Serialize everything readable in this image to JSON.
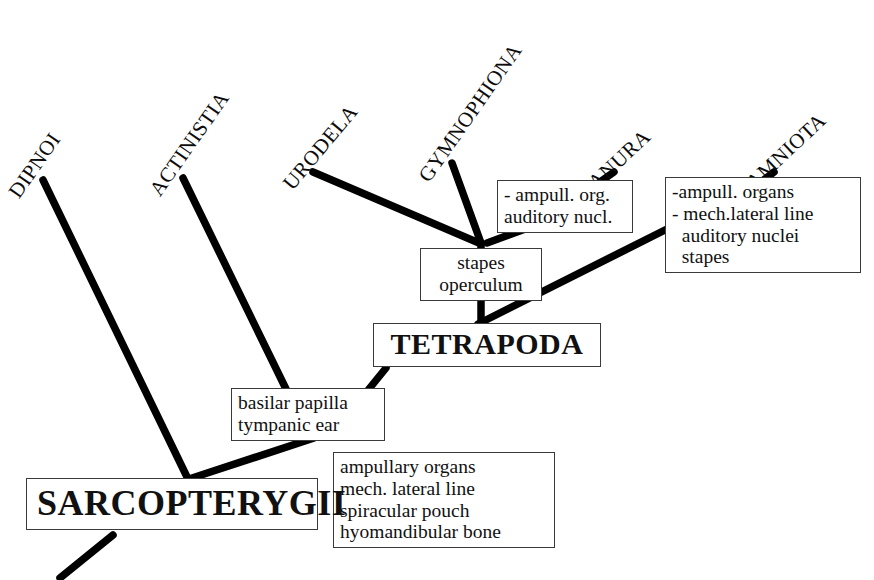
{
  "diagram": {
    "type": "cladogram",
    "background_color": "#ffffff",
    "line_color": "#000000",
    "box_border_color": "#3a3a3a"
  },
  "taxa": [
    {
      "id": "dipnoi",
      "label": "DIPNOI"
    },
    {
      "id": "actinistia",
      "label": "ACTINISTIA"
    },
    {
      "id": "urodela",
      "label": "URODELA"
    },
    {
      "id": "gymnophiona",
      "label": "GYMNOPHIONA"
    },
    {
      "id": "anura",
      "label": "ANURA"
    },
    {
      "id": "amniota",
      "label": "AMNIOTA"
    }
  ],
  "clades": [
    {
      "id": "sarcopterygii",
      "label": "SARCOPTERYGII"
    },
    {
      "id": "tetrapoda",
      "label": "TETRAPODA"
    }
  ],
  "character_boxes": [
    {
      "id": "anura-characters",
      "attached_to": "anura",
      "lines": [
        "- ampull. org.",
        "auditory nucl."
      ]
    },
    {
      "id": "amniota-characters",
      "attached_to": "amniota",
      "lines": [
        "-ampull. organs",
        "- mech.lateral line",
        "  auditory nuclei",
        "  stapes"
      ]
    },
    {
      "id": "lissamphibia-characters",
      "attached_to": "lissamphibia-node",
      "lines": [
        "stapes",
        "operculum"
      ]
    },
    {
      "id": "tetrapoda-characters",
      "attached_to": "tetrapoda-stem",
      "lines": [
        "basilar papilla",
        "tympanic ear"
      ]
    },
    {
      "id": "sarcopterygii-characters",
      "attached_to": "sarcopterygii-node",
      "lines": [
        "ampullary organs",
        "mech. lateral line",
        "spiracular pouch",
        "hyomandibular bone"
      ]
    }
  ]
}
